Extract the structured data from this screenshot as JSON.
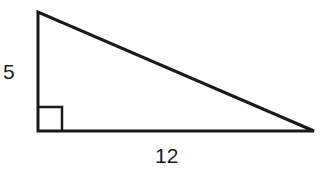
{
  "diagram": {
    "type": "right-triangle",
    "vertices": {
      "top": [
        38,
        12
      ],
      "right_angle": [
        38,
        131
      ],
      "right": [
        314,
        131
      ]
    },
    "legs": {
      "vertical": "5",
      "horizontal": "12"
    },
    "right_angle_marker": true,
    "stroke_color": "#1a1a1a"
  }
}
